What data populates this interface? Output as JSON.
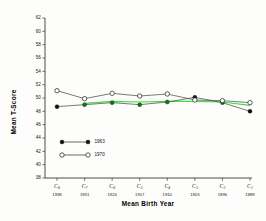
{
  "chart_data": {
    "type": "line",
    "title": "",
    "xlabel": "Mean   Birth   Year",
    "ylabel": "Mean   T-Score",
    "ylim": [
      38,
      62
    ],
    "yticks": [
      38,
      40,
      42,
      44,
      46,
      48,
      50,
      52,
      54,
      56,
      58,
      60,
      62
    ],
    "grid": false,
    "legend_position": "lower-left-inside",
    "categories": [
      "C8",
      "C7",
      "C6",
      "C5",
      "C4",
      "C3",
      "C2",
      "C1"
    ],
    "category_labels": [
      {
        "cohort": "C",
        "subscript": "8",
        "year": "1938"
      },
      {
        "cohort": "C",
        "subscript": "7",
        "year": "1931"
      },
      {
        "cohort": "C",
        "subscript": "6",
        "year": "1924"
      },
      {
        "cohort": "C",
        "subscript": "5",
        "year": "1917"
      },
      {
        "cohort": "C",
        "subscript": "4",
        "year": "1910"
      },
      {
        "cohort": "C",
        "subscript": "3",
        "year": "1903"
      },
      {
        "cohort": "C",
        "subscript": "2",
        "year": "1896"
      },
      {
        "cohort": "C",
        "subscript": "1",
        "year": "1889"
      }
    ],
    "series": [
      {
        "name": "1963",
        "marker": "filled-circle",
        "color": "#101010",
        "values": [
          48.7,
          49.0,
          49.3,
          49.0,
          49.4,
          50.1,
          49.3,
          48.0
        ]
      },
      {
        "name": "1970",
        "marker": "open-circle",
        "color": "#2a2a2a",
        "values": [
          51.1,
          49.9,
          50.7,
          50.3,
          50.6,
          49.7,
          49.6,
          49.3
        ]
      },
      {
        "name": "smoothed-overlay",
        "marker": "none",
        "color": "#3fdd3f",
        "values": [
          null,
          49.2,
          49.5,
          49.4,
          49.5,
          49.5,
          49.4,
          48.9
        ]
      }
    ],
    "legend": [
      {
        "label": "1963",
        "marker": "filled-circle"
      },
      {
        "label": "1970",
        "marker": "open-circle"
      }
    ]
  }
}
